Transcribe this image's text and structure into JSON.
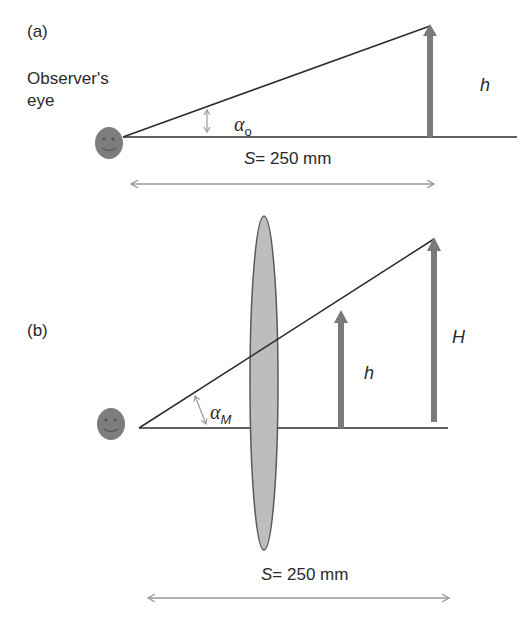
{
  "panel_a": {
    "label": "(a)",
    "observer_label_line1": "Observer's",
    "observer_label_line2": "eye",
    "angle_symbol": "α",
    "angle_subscript": "o",
    "object_height_label": "h",
    "distance_var": "S",
    "distance_value": "= 250 mm"
  },
  "panel_b": {
    "label": "(b)",
    "angle_symbol": "α",
    "angle_subscript": "M",
    "object_height_label": "h",
    "image_height_label": "H",
    "distance_var": "S",
    "distance_value": "= 250 mm"
  },
  "colors": {
    "line": "#2b2b2b",
    "arrow_fill": "#7a7a7a",
    "eye_fill": "#7d7d7d",
    "lens_fill": "#bdbdbd",
    "lens_stroke": "#5a5a5a",
    "dimension_arrow": "#9a9a9a"
  }
}
